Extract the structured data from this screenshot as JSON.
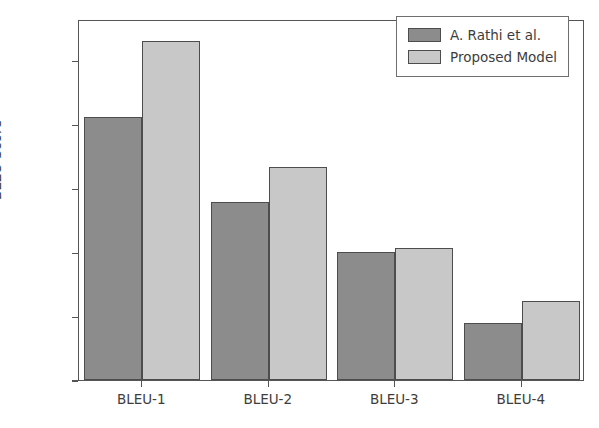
{
  "chart_data": {
    "type": "bar",
    "title": "",
    "xlabel": "",
    "ylabel": "BLEU Score",
    "categories": [
      "BLEU-1",
      "BLEU-2",
      "BLEU-3",
      "BLEU-4"
    ],
    "series": [
      {
        "name": "A. Rathi et al.",
        "color": "#8c8c8c",
        "values": [
          0.412,
          0.278,
          0.201,
          0.089
        ]
      },
      {
        "name": "Proposed Model",
        "color": "#c8c8c8",
        "values": [
          0.531,
          0.333,
          0.206,
          0.123
        ]
      }
    ],
    "ylim": [
      0.0,
      0.565
    ],
    "yticks": [
      0.0,
      0.1,
      0.2,
      0.3,
      0.4,
      0.5
    ],
    "ytick_labels": [
      "0.0",
      "0.1",
      "0.2",
      "0.3",
      "0.4",
      "0.5"
    ],
    "grid": false,
    "legend_position": "upper right",
    "edge_color": "#4d4d4d",
    "axis_color": "#555555"
  }
}
